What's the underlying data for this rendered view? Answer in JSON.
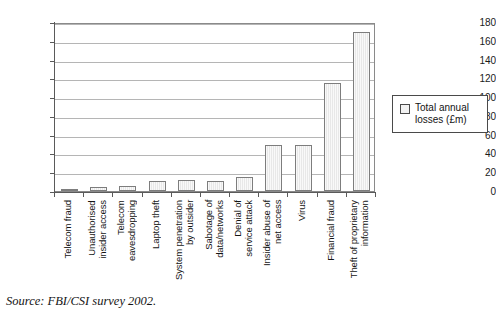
{
  "chart_data": {
    "type": "bar",
    "title": "",
    "xlabel": "",
    "ylabel": "",
    "ylim": [
      0,
      180
    ],
    "ytick_step": 20,
    "yticks": [
      180,
      160,
      140,
      120,
      100,
      80,
      60,
      40,
      20,
      0
    ],
    "grid": true,
    "legend_position": "right",
    "categories": [
      "Telecom fraud",
      "Unauthorised insider access",
      "Telecom eavesdropping",
      "Laptop theft",
      "System penetration by outsider",
      "Sabotage of data/networks",
      "Denial of service attack",
      "Insider abuse of net access",
      "Virus",
      "Financial fraud",
      "Theft of proprietary information"
    ],
    "category_lines": [
      [
        "Telecom fraud"
      ],
      [
        "Unauthorised",
        "insider access"
      ],
      [
        "Telecom",
        "eavesdropping"
      ],
      [
        "Laptop theft"
      ],
      [
        "System penetration",
        "by outsider"
      ],
      [
        "Sabotage of",
        "data/networks"
      ],
      [
        "Denial of",
        "service attack"
      ],
      [
        "Insider abuse of",
        "net access"
      ],
      [
        "Virus"
      ],
      [
        "Financial fraud"
      ],
      [
        "Theft of proprietary",
        "information"
      ]
    ],
    "series": [
      {
        "name": "Total annual losses (£m)",
        "values": [
          0.5,
          4,
          5,
          11,
          12,
          11,
          15,
          49,
          49,
          115,
          169
        ]
      }
    ],
    "bar_color": "#e8e8e8",
    "bar_border_color": "#7d7d7d"
  },
  "legend": {
    "entries": [
      {
        "label": "Total annual\nlosses (£m)",
        "swatch": "legend-swatch-total-annual-losses"
      }
    ]
  },
  "source": {
    "text": "Source: FBI/CSI survey 2002."
  }
}
